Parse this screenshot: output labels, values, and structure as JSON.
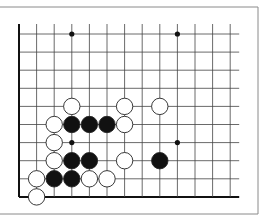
{
  "diagram": {
    "type": "go-board-fragment",
    "frame": {
      "color": "#8a8a8a"
    },
    "grid": {
      "columns": 13,
      "rows": 10,
      "line_color": "#444444",
      "edge_color": "#111111",
      "left_edge": true,
      "bottom_edge": true
    },
    "star_points": [
      {
        "col": 3,
        "row": 0
      },
      {
        "col": 9,
        "row": 0
      },
      {
        "col": 3,
        "row": 6
      },
      {
        "col": 9,
        "row": 6
      }
    ],
    "stones": [
      {
        "color": "white",
        "col": 3,
        "row": 4
      },
      {
        "color": "white",
        "col": 6,
        "row": 4
      },
      {
        "color": "white",
        "col": 8,
        "row": 4
      },
      {
        "color": "white",
        "col": 2,
        "row": 5
      },
      {
        "color": "black",
        "col": 3,
        "row": 5
      },
      {
        "color": "black",
        "col": 4,
        "row": 5
      },
      {
        "color": "black",
        "col": 5,
        "row": 5
      },
      {
        "color": "white",
        "col": 6,
        "row": 5
      },
      {
        "color": "white",
        "col": 2,
        "row": 6
      },
      {
        "color": "white",
        "col": 2,
        "row": 7
      },
      {
        "color": "black",
        "col": 3,
        "row": 7
      },
      {
        "color": "black",
        "col": 4,
        "row": 7
      },
      {
        "color": "white",
        "col": 6,
        "row": 7
      },
      {
        "color": "black",
        "col": 8,
        "row": 7
      },
      {
        "color": "white",
        "col": 1,
        "row": 8
      },
      {
        "color": "black",
        "col": 2,
        "row": 8
      },
      {
        "color": "black",
        "col": 3,
        "row": 8
      },
      {
        "color": "white",
        "col": 4,
        "row": 8
      },
      {
        "color": "white",
        "col": 5,
        "row": 8
      },
      {
        "color": "white",
        "col": 1,
        "row": 9
      }
    ]
  }
}
